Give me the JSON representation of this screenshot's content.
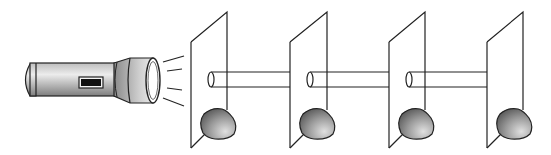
{
  "diagram": {
    "background": "#ffffff",
    "stroke_color": "#222222",
    "flashlight": {
      "label": "flashlight",
      "body_color_light": "#e6e6e6",
      "body_color_dark": "#8a8a8a",
      "switch_color": "#111111",
      "light_rays": 4
    },
    "screens": [
      {
        "label": "screen-1",
        "x": 191
      },
      {
        "label": "screen-2",
        "x": 290
      },
      {
        "label": "screen-3",
        "x": 389
      },
      {
        "label": "screen-4",
        "x": 487
      }
    ],
    "tubes": [
      {
        "label": "tube-1",
        "from": 208,
        "to": 290
      },
      {
        "label": "tube-2",
        "from": 308,
        "to": 389
      },
      {
        "label": "tube-3",
        "from": 407,
        "to": 487
      }
    ],
    "clay_color_light": "#d0d0d0",
    "clay_color_dark": "#5a5a5a"
  }
}
